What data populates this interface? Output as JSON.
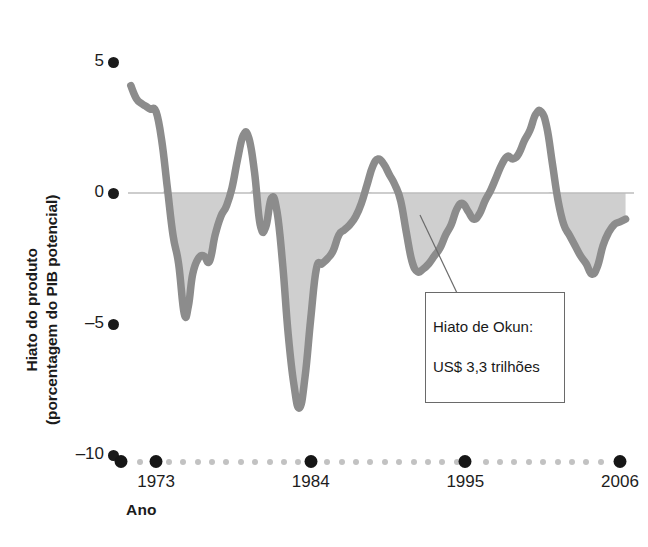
{
  "chart_data": {
    "type": "area",
    "title": "",
    "xlabel": "Ano",
    "ylabel": "Hiato do produto\n(porcentagem do PIB potencial)",
    "xlim": [
      1971.0,
      2007.0
    ],
    "ylim": [
      -10,
      5
    ],
    "yticks": [
      5,
      0,
      -5,
      -10
    ],
    "ytick_labels": [
      "5",
      "0",
      "–5",
      "–10"
    ],
    "xticks": [
      1973,
      1984,
      1995,
      2006
    ],
    "xtick_labels": [
      "1973",
      "1984",
      "1995",
      "2006"
    ],
    "grid": false,
    "legend": null,
    "series_name": "Hiato do produto",
    "line_color": "#8c8c8c",
    "fill_color": "#cfcfcf",
    "zero_line_color": "#bdbdbd",
    "axis_dot_color": "#161616",
    "axis_minor_dot_color": "#c2c2c2",
    "x": [
      1971.2,
      1971.6,
      1972.0,
      1972.3,
      1972.6,
      1973.0,
      1973.4,
      1973.8,
      1974.2,
      1974.6,
      1975.0,
      1975.3,
      1975.6,
      1976.0,
      1976.4,
      1976.8,
      1977.2,
      1977.6,
      1978.0,
      1978.4,
      1978.8,
      1979.2,
      1979.6,
      1980.0,
      1980.4,
      1980.8,
      1981.2,
      1981.6,
      1982.0,
      1982.4,
      1982.8,
      1983.2,
      1983.6,
      1984.0,
      1984.4,
      1984.8,
      1985.2,
      1985.6,
      1986.0,
      1986.4,
      1986.8,
      1987.2,
      1987.6,
      1988.0,
      1988.4,
      1988.8,
      1989.2,
      1989.6,
      1990.0,
      1990.4,
      1990.8,
      1991.2,
      1991.6,
      1992.0,
      1992.4,
      1992.8,
      1993.2,
      1993.6,
      1994.0,
      1994.4,
      1994.8,
      1995.2,
      1995.6,
      1996.0,
      1996.4,
      1996.8,
      1997.2,
      1997.6,
      1998.0,
      1998.4,
      1998.8,
      1999.2,
      1999.6,
      2000.0,
      2000.4,
      2000.8,
      2001.2,
      2001.6,
      2002.0,
      2002.4,
      2002.8,
      2003.2,
      2003.6,
      2004.0,
      2004.4,
      2004.8,
      2005.2,
      2005.6,
      2006.0,
      2006.4
    ],
    "y": [
      4.1,
      3.6,
      3.4,
      3.3,
      3.2,
      3.1,
      2.0,
      0.2,
      -1.6,
      -2.7,
      -4.6,
      -4.3,
      -3.1,
      -2.5,
      -2.4,
      -2.6,
      -1.6,
      -0.9,
      -0.5,
      0.2,
      1.3,
      2.2,
      2.1,
      0.8,
      -1.2,
      -1.3,
      -0.2,
      -0.7,
      -2.7,
      -5.4,
      -7.3,
      -8.2,
      -7.0,
      -4.8,
      -2.9,
      -2.7,
      -2.5,
      -2.2,
      -1.6,
      -1.4,
      -1.2,
      -0.9,
      -0.4,
      0.3,
      1.0,
      1.3,
      1.1,
      0.7,
      0.3,
      -0.3,
      -1.5,
      -2.6,
      -3.0,
      -2.9,
      -2.7,
      -2.4,
      -2.1,
      -1.6,
      -1.2,
      -0.6,
      -0.4,
      -0.7,
      -1.0,
      -0.8,
      -0.3,
      0.1,
      0.6,
      1.1,
      1.4,
      1.3,
      1.5,
      2.0,
      2.4,
      3.0,
      3.1,
      2.5,
      1.1,
      -0.3,
      -1.2,
      -1.6,
      -2.0,
      -2.4,
      -2.7,
      -3.1,
      -2.8,
      -2.0,
      -1.5,
      -1.2,
      -1.1,
      -1.0
    ],
    "annotations": [
      {
        "text": "Hiato de Okun:\nUS$ 3,3 trilhões",
        "line_1": "Hiato de Okun:",
        "line_2": "US$ 3,3 trilhões",
        "pointer_x": 420,
        "pointer_y": 215
      }
    ]
  },
  "axes": {
    "y_title": "Hiato do produto\n(porcentagem do PIB potencial)",
    "x_title": "Ano",
    "y_ticks": [
      {
        "label": "5",
        "value": 5
      },
      {
        "label": "0",
        "value": 0
      },
      {
        "label": "–5",
        "value": -5
      },
      {
        "label": "–10",
        "value": -10
      }
    ],
    "x_ticks": [
      {
        "label": "1973",
        "value": 1973
      },
      {
        "label": "1984",
        "value": 1984
      },
      {
        "label": "1995",
        "value": 1995
      },
      {
        "label": "2006",
        "value": 2006
      }
    ]
  },
  "annotation": {
    "line_1": "Hiato de Okun:",
    "line_2": "US$ 3,3 trilhões"
  },
  "colors": {
    "line": "#8c8c8c",
    "fill": "#cfcfcf",
    "zero_line": "#bdbdbd",
    "text": "#1b1b1b",
    "tick_dot": "#161616",
    "minor_dot": "#c2c2c2"
  }
}
